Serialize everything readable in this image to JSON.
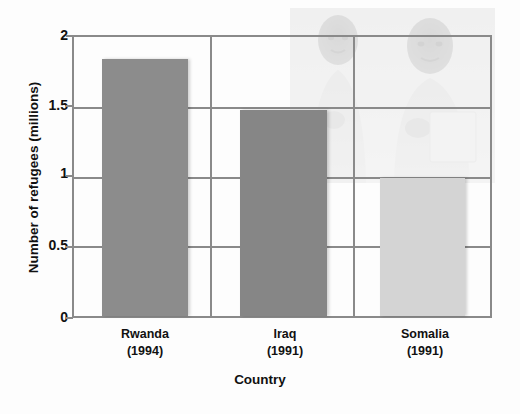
{
  "chart_data": {
    "type": "bar",
    "title": "",
    "categories": [
      "Rwanda",
      "Iraq",
      "Somalia"
    ],
    "category_years": [
      "(1994)",
      "(1991)",
      "(1991)"
    ],
    "values": [
      1.84,
      1.48,
      0.99
    ],
    "xlabel": "Country",
    "ylabel": "Number of refugees (millions)",
    "ylim": [
      0,
      2
    ],
    "yticks": [
      0,
      0.5,
      1,
      1.5,
      2
    ],
    "ytick_labels": [
      "0",
      "0.5",
      "1",
      "1.5",
      "2"
    ],
    "grid": true,
    "legend": false,
    "bar_colors": [
      "#8c8c8c",
      "#868686",
      "#d4d4d4"
    ],
    "axis_color": "#8a8a8a",
    "background": "#fdfdfd",
    "watermark": "faded photograph of two people behind the plot area"
  }
}
